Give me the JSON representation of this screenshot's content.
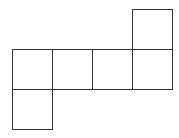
{
  "diagram": {
    "type": "cube-net",
    "stroke_color": "#333333",
    "background": "#ffffff",
    "squares": [
      {
        "id": "top-right",
        "x": 132,
        "y": 9,
        "size": 40
      },
      {
        "id": "row-1",
        "x": 12,
        "y": 49,
        "size": 40
      },
      {
        "id": "row-2",
        "x": 52,
        "y": 49,
        "size": 40
      },
      {
        "id": "row-3",
        "x": 92,
        "y": 49,
        "size": 40
      },
      {
        "id": "row-4",
        "x": 132,
        "y": 49,
        "size": 40
      },
      {
        "id": "bottom-left",
        "x": 12,
        "y": 89,
        "size": 40
      }
    ]
  }
}
